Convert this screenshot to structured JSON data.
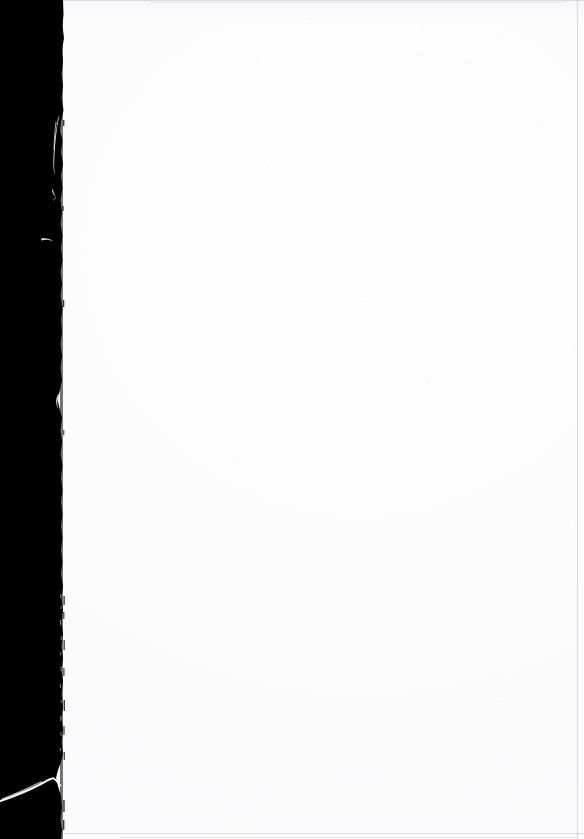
{
  "document": {
    "kind": "scanned-page",
    "title": "Scanned blank page",
    "page_content": "",
    "content_note": "Page is blank — no printed text, figures or marks are visible.",
    "orientation": "portrait",
    "width_px": 584,
    "height_px": 839
  },
  "colors": {
    "scanner_bed": "#000000",
    "paper": "#fefeff",
    "paper_tone": "#f6f6f8",
    "edge_rule": "#969ba2",
    "fiber_highlight": "#ffffff"
  },
  "regions": {
    "scanner_margin": {
      "name": "black scanner bed margin",
      "side": "left",
      "approx_width_px": 62,
      "description": "Solid black band down the left side where the scanner lid showed through past the edge of the sheet."
    },
    "paper_edge": {
      "name": "torn page edge",
      "description": "Ragged, slightly curled left edge of the sheet running top to bottom, with frayed paper fibers.",
      "approx_x_px": 62
    },
    "fibers": [
      {
        "name": "fiber-wisp-upper",
        "approx_y_px": 130,
        "description": "thin vertical white paper fiber lifted off the torn edge"
      },
      {
        "name": "fiber-crescent",
        "approx_y_px": 240,
        "description": "small curved white crescent mark"
      },
      {
        "name": "fiber-notch",
        "approx_y_px": 400,
        "description": "small white notch in the torn edge"
      },
      {
        "name": "fiber-streak-lower",
        "approx_y_px": 790,
        "description": "long diagonal white streak from the curled bottom corner"
      }
    ],
    "rules": [
      {
        "name": "top-edge-rule",
        "position": "top",
        "tone": "faint gray"
      },
      {
        "name": "right-edge-rule",
        "position": "right",
        "tone": "faint gray"
      },
      {
        "name": "bottom-edge-rule",
        "position": "bottom",
        "tone": "faint gray"
      }
    ]
  }
}
